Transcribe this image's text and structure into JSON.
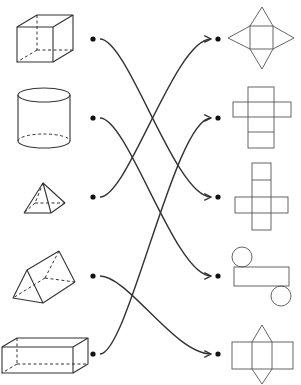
{
  "solids": [
    {
      "id": "cube",
      "label": "Cube"
    },
    {
      "id": "cylinder",
      "label": "Cylinder"
    },
    {
      "id": "square-pyramid",
      "label": "Square pyramid"
    },
    {
      "id": "triangular-prism",
      "label": "Triangular prism"
    },
    {
      "id": "rectangular-prism",
      "label": "Rectangular prism"
    }
  ],
  "nets": [
    {
      "id": "square-pyramid-net",
      "label": "Square pyramid net"
    },
    {
      "id": "rectangular-prism-net",
      "label": "Rectangular prism net"
    },
    {
      "id": "cube-net",
      "label": "Cube net"
    },
    {
      "id": "cylinder-net",
      "label": "Cylinder net"
    },
    {
      "id": "triangular-prism-net",
      "label": "Triangular prism net"
    }
  ],
  "connections": [
    {
      "from": 0,
      "to": 2
    },
    {
      "from": 1,
      "to": 3
    },
    {
      "from": 2,
      "to": 0
    },
    {
      "from": 3,
      "to": 4
    },
    {
      "from": 4,
      "to": 1
    }
  ],
  "colors": {
    "stroke": "#333333",
    "dot": "#111111"
  }
}
